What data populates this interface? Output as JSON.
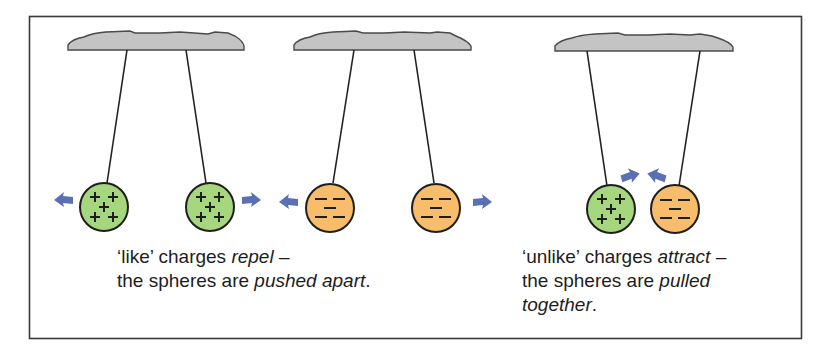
{
  "figure": {
    "colors": {
      "frame": "#3a3a3a",
      "support_fill": "#c4c4c4",
      "support_stroke": "#4a4a4a",
      "string": "#222222",
      "positive_sphere": "#a6d67e",
      "negative_sphere": "#f7bd6a",
      "sphere_outline": "#1e1e1e",
      "arrow": "#5b6fb5",
      "text": "#1d1d1d"
    },
    "panels": [
      {
        "id": "like-positive",
        "spheres": [
          {
            "charge": "positive",
            "symbols": "+ + + + +"
          },
          {
            "charge": "positive",
            "symbols": "+ + + + +"
          }
        ],
        "force": "repel",
        "arrow-direction": "outward"
      },
      {
        "id": "like-negative",
        "spheres": [
          {
            "charge": "negative",
            "symbols": "− − − − −"
          },
          {
            "charge": "negative",
            "symbols": "− − − − −"
          }
        ],
        "force": "repel",
        "arrow-direction": "outward"
      },
      {
        "id": "unlike",
        "spheres": [
          {
            "charge": "positive",
            "symbols": "+ + + + +"
          },
          {
            "charge": "negative",
            "symbols": "− − − − −"
          }
        ],
        "force": "attract",
        "arrow-direction": "inward"
      }
    ],
    "captions": {
      "like": {
        "line1_pre": "‘like’ charges ",
        "line1_em": "repel",
        "line1_post": " –",
        "line2_pre": "the spheres are ",
        "line2_em": "pushed apart",
        "line2_post": "."
      },
      "unlike": {
        "line1_pre": "‘unlike’ charges ",
        "line1_em": "attract",
        "line1_post": " –",
        "line2_pre": "the spheres are ",
        "line2_em": "pulled",
        "line3_em": "together",
        "line3_post": "."
      }
    }
  }
}
